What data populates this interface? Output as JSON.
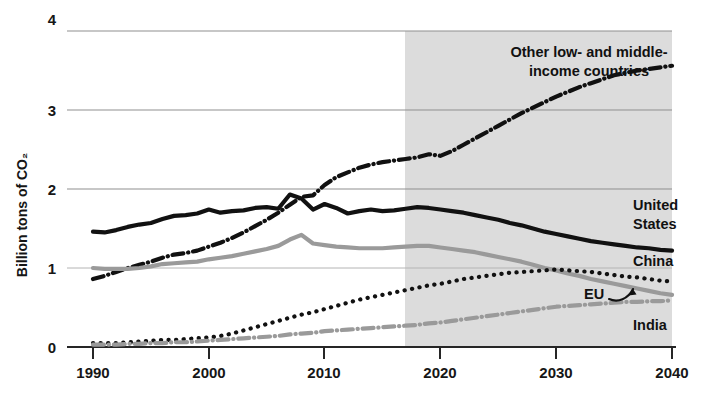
{
  "chart_data": {
    "type": "line",
    "title": "",
    "xlabel": "",
    "ylabel": "Billion tons of CO₂",
    "xlim": [
      1990,
      2040
    ],
    "ylim": [
      0,
      4
    ],
    "xticks": [
      1990,
      2000,
      2010,
      2020,
      2030,
      2040
    ],
    "yticks": [
      0,
      1,
      2,
      3,
      4
    ],
    "xtick_labels": [
      "1990",
      "2000",
      "2010",
      "2020",
      "2030",
      "2040"
    ],
    "ytick_labels": [
      "0",
      "1",
      "2",
      "3",
      "4"
    ],
    "grid": "horizontal",
    "legend_position": "inline-right-labels",
    "projection_start": 2017,
    "projection_shading_color": "#dcdcdc",
    "annotations": [
      {
        "name": "eu-arrow",
        "text": "EU",
        "points_to": "eu-series"
      }
    ],
    "x": [
      1990,
      1991,
      1992,
      1993,
      1994,
      1995,
      1996,
      1997,
      1998,
      1999,
      2000,
      2001,
      2002,
      2003,
      2004,
      2005,
      2006,
      2007,
      2008,
      2009,
      2010,
      2011,
      2012,
      2013,
      2014,
      2015,
      2016,
      2017,
      2018,
      2019,
      2020,
      2021,
      2022,
      2023,
      2024,
      2025,
      2026,
      2027,
      2028,
      2029,
      2030,
      2031,
      2032,
      2033,
      2034,
      2035,
      2036,
      2037,
      2038,
      2039,
      2040
    ],
    "series": [
      {
        "name": "Other low- and middle-income countries",
        "label": "Other low- and middle-\nincome countries",
        "color": "#111111",
        "style": "dashdot",
        "width": 4.2,
        "values": [
          0.86,
          0.9,
          0.95,
          1.0,
          1.04,
          1.08,
          1.13,
          1.17,
          1.19,
          1.22,
          1.27,
          1.32,
          1.38,
          1.45,
          1.53,
          1.61,
          1.7,
          1.8,
          1.9,
          1.92,
          2.05,
          2.15,
          2.21,
          2.27,
          2.31,
          2.34,
          2.36,
          2.38,
          2.4,
          2.44,
          2.42,
          2.48,
          2.56,
          2.64,
          2.72,
          2.8,
          2.88,
          2.96,
          3.03,
          3.1,
          3.17,
          3.23,
          3.29,
          3.34,
          3.39,
          3.44,
          3.47,
          3.5,
          3.52,
          3.54,
          3.56
        ]
      },
      {
        "name": "United States",
        "label": "United States",
        "color": "#111111",
        "style": "solid",
        "width": 4.2,
        "values": [
          1.46,
          1.45,
          1.48,
          1.52,
          1.55,
          1.57,
          1.62,
          1.66,
          1.67,
          1.69,
          1.74,
          1.7,
          1.72,
          1.73,
          1.76,
          1.77,
          1.75,
          1.93,
          1.88,
          1.74,
          1.81,
          1.76,
          1.69,
          1.72,
          1.74,
          1.72,
          1.73,
          1.75,
          1.77,
          1.76,
          1.74,
          1.72,
          1.7,
          1.67,
          1.64,
          1.61,
          1.57,
          1.54,
          1.5,
          1.46,
          1.43,
          1.4,
          1.37,
          1.34,
          1.32,
          1.3,
          1.28,
          1.26,
          1.25,
          1.23,
          1.22
        ]
      },
      {
        "name": "EU",
        "label": "EU",
        "color": "#9a9a9a",
        "style": "solid",
        "width": 4.2,
        "values": [
          1.0,
          0.99,
          0.99,
          0.99,
          1.0,
          1.02,
          1.05,
          1.06,
          1.07,
          1.08,
          1.11,
          1.13,
          1.15,
          1.18,
          1.21,
          1.24,
          1.28,
          1.36,
          1.42,
          1.31,
          1.29,
          1.27,
          1.26,
          1.25,
          1.25,
          1.25,
          1.26,
          1.27,
          1.28,
          1.28,
          1.26,
          1.24,
          1.22,
          1.2,
          1.17,
          1.14,
          1.11,
          1.08,
          1.04,
          1.0,
          0.97,
          0.93,
          0.9,
          0.86,
          0.83,
          0.8,
          0.77,
          0.74,
          0.71,
          0.68,
          0.66
        ]
      },
      {
        "name": "China",
        "label": "China",
        "color": "#111111",
        "style": "dotted",
        "width": 4.2,
        "values": [
          0.05,
          0.05,
          0.05,
          0.06,
          0.07,
          0.08,
          0.09,
          0.09,
          0.1,
          0.11,
          0.12,
          0.14,
          0.17,
          0.21,
          0.25,
          0.29,
          0.33,
          0.37,
          0.41,
          0.44,
          0.48,
          0.52,
          0.56,
          0.6,
          0.63,
          0.66,
          0.69,
          0.72,
          0.75,
          0.78,
          0.8,
          0.83,
          0.86,
          0.88,
          0.9,
          0.92,
          0.94,
          0.95,
          0.96,
          0.97,
          0.98,
          0.97,
          0.96,
          0.95,
          0.93,
          0.91,
          0.89,
          0.88,
          0.86,
          0.84,
          0.83
        ]
      },
      {
        "name": "India",
        "label": "India",
        "color": "#9a9a9a",
        "style": "dashdot",
        "width": 4.2,
        "values": [
          0.03,
          0.03,
          0.03,
          0.04,
          0.04,
          0.05,
          0.05,
          0.06,
          0.06,
          0.07,
          0.08,
          0.09,
          0.1,
          0.11,
          0.12,
          0.13,
          0.14,
          0.16,
          0.17,
          0.18,
          0.2,
          0.21,
          0.22,
          0.23,
          0.24,
          0.25,
          0.26,
          0.27,
          0.28,
          0.3,
          0.31,
          0.33,
          0.35,
          0.37,
          0.39,
          0.41,
          0.43,
          0.45,
          0.47,
          0.49,
          0.51,
          0.52,
          0.53,
          0.54,
          0.55,
          0.56,
          0.57,
          0.57,
          0.58,
          0.58,
          0.59
        ]
      }
    ],
    "series_labels": [
      {
        "name": "other-lmi-label",
        "line1": "Other low- and middle-",
        "line2": "income countries"
      },
      {
        "name": "united-states-label",
        "line1": "United",
        "line2": "States"
      },
      {
        "name": "china-label",
        "line1": "China",
        "line2": ""
      },
      {
        "name": "eu-label",
        "line1": "EU",
        "line2": ""
      },
      {
        "name": "india-label",
        "line1": "India",
        "line2": ""
      }
    ]
  }
}
